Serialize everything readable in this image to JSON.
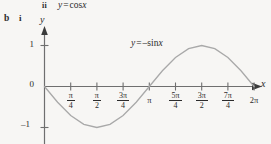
{
  "header": {
    "part_numeral": "ii",
    "equation_prefix": "y",
    "equation_operator": "=",
    "equation_function": "cos",
    "equation_variable": "x"
  },
  "part_labels": {
    "outer": "b",
    "inner": "i"
  },
  "axes": {
    "y_axis_label": "y",
    "x_axis_label": "x"
  },
  "curve_label": {
    "lhs": "y",
    "operator": "=",
    "sign": "–",
    "function": "sin",
    "variable": "x"
  },
  "y_ticks": [
    {
      "label": "1"
    },
    {
      "label": "0"
    },
    {
      "label": "–1"
    }
  ],
  "x_ticks": [
    {
      "numerator": "π",
      "denominator": "4",
      "plain": null
    },
    {
      "numerator": "π",
      "denominator": "2",
      "plain": null
    },
    {
      "numerator": "3π",
      "denominator": "4",
      "plain": null
    },
    {
      "numerator": null,
      "denominator": null,
      "plain": "π"
    },
    {
      "numerator": "5π",
      "denominator": "4",
      "plain": null
    },
    {
      "numerator": "3π",
      "denominator": "2",
      "plain": null
    },
    {
      "numerator": "7π",
      "denominator": "4",
      "plain": null
    },
    {
      "numerator": null,
      "denominator": null,
      "plain": "2π"
    }
  ],
  "colors": {
    "background": "#f7f6f4",
    "ink": "#2b2b2b",
    "axis": "#6f6f6f",
    "curve": "#a9a9a9"
  },
  "chart_data": {
    "type": "line",
    "title": "",
    "subtitle": "",
    "xlabel": "x",
    "ylabel": "y",
    "annotations": [
      "y = –sin x"
    ],
    "grid": false,
    "legend": "none",
    "xlim": [
      0,
      6.283185307
    ],
    "ylim": [
      -1.3,
      1.3
    ],
    "xtick_values": [
      0.785398,
      1.570796,
      2.356194,
      3.141593,
      3.926991,
      4.712389,
      5.497787,
      6.283185
    ],
    "xtick_labels": [
      "π/4",
      "π/2",
      "3π/4",
      "π",
      "5π/4",
      "3π/2",
      "7π/4",
      "2π"
    ],
    "ytick_values": [
      1,
      0,
      -1
    ],
    "ytick_labels": [
      "1",
      "0",
      "–1"
    ],
    "series": [
      {
        "name": "y = -sin x",
        "expression": "y = -sin(x)",
        "color": "#a9a9a9",
        "x": [
          0,
          0.3927,
          0.7854,
          1.1781,
          1.5708,
          1.9635,
          2.3562,
          2.7489,
          3.1416,
          3.5343,
          3.927,
          4.3197,
          4.7124,
          5.1051,
          5.4978,
          5.8905,
          6.2832
        ],
        "y": [
          0,
          -0.3827,
          -0.7071,
          -0.9239,
          -1,
          -0.9239,
          -0.7071,
          -0.3827,
          0,
          0.3827,
          0.7071,
          0.9239,
          1,
          0.9239,
          0.7071,
          0.3827,
          0
        ]
      }
    ]
  }
}
